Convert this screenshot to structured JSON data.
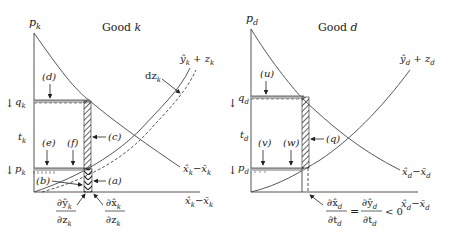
{
  "left_panel": {
    "title": "Good k",
    "y_axis_label": "p_k",
    "x_axis_label": "x̂_k − x̄_k",
    "supply_curve_label": "ŷ_k + z_k",
    "shift_label": "dz_k",
    "demand_curve_label": "x̂_k − x̄_k",
    "price_levels": {
      "upper": "q_k",
      "tax": "t_k",
      "lower": "p_k"
    },
    "areas": [
      "(a)",
      "(b)",
      "(c)",
      "(d)",
      "(e)",
      "(f)"
    ],
    "derivatives": {
      "left": {
        "num": "∂ŷ_k",
        "den": "∂z_k"
      },
      "right": {
        "num": "∂x̂_k",
        "den": "∂z_k"
      }
    }
  },
  "right_panel": {
    "title": "Good d",
    "y_axis_label": "p_d",
    "x_axis_label": "x̂_d − x̄_d",
    "supply_curve_label": "ŷ_d + z_d",
    "demand_curve_label": "x̂_d − x̄_d",
    "price_levels": {
      "upper": "q_d",
      "tax": "t_d",
      "lower": "p_d"
    },
    "areas": [
      "(u)",
      "(v)",
      "(w)",
      "(q)"
    ],
    "condition": {
      "lhs_num": "∂x̂_d",
      "lhs_den": "∂t_d",
      "eq": "=",
      "rhs_num": "∂ŷ_d",
      "rhs_den": "∂t_d",
      "ineq": "< 0"
    }
  },
  "colors": {
    "line": "#444444",
    "band": "#b8b8b8",
    "text": "#222222"
  }
}
